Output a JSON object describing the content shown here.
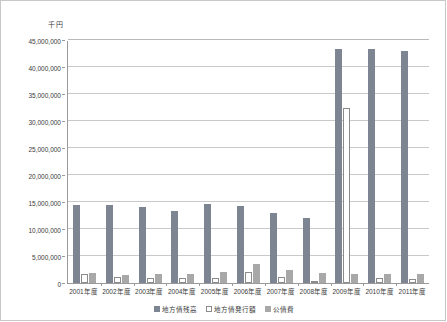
{
  "chart_data": {
    "type": "bar",
    "title": "",
    "unit_label": "千円",
    "xlabel": "",
    "ylabel": "",
    "ylim": [
      0,
      45000000
    ],
    "ytick_values": [
      0,
      5000000,
      10000000,
      15000000,
      20000000,
      25000000,
      30000000,
      35000000,
      40000000,
      45000000
    ],
    "ytick_labels": [
      "0",
      "5,000,000",
      "10,000,000",
      "15,000,000",
      "20,000,000",
      "25,000,000",
      "30,000,000",
      "35,000,000",
      "40,000,000",
      "45,000,000"
    ],
    "grid": true,
    "legend_position": "bottom",
    "categories": [
      "2001年度",
      "2002年度",
      "2003年度",
      "2004年度",
      "2005年度",
      "2006年度",
      "2007年度",
      "2008年度",
      "2009年度",
      "2010年度",
      "2011年度"
    ],
    "series": [
      {
        "name": "地方債残高",
        "color": "#7d8592",
        "values": [
          14500000,
          14500000,
          14000000,
          13350000,
          14600000,
          14350000,
          12900000,
          11950000,
          43300000,
          43300000,
          43050000
        ]
      },
      {
        "name": "地方債発行額",
        "color": "#ffffff",
        "values": [
          1750000,
          1150000,
          850000,
          900000,
          1000000,
          2000000,
          1150000,
          400000,
          32500000,
          900000,
          800000
        ]
      },
      {
        "name": "公債費",
        "color": "#a8a8a8",
        "values": [
          1900000,
          1550000,
          1750000,
          1700000,
          2100000,
          3450000,
          2500000,
          1900000,
          1600000,
          1700000,
          1700000
        ]
      }
    ]
  },
  "legend": {
    "items": [
      {
        "label": "地方債残高"
      },
      {
        "label": "地方債発行額"
      },
      {
        "label": "公債費"
      }
    ]
  }
}
